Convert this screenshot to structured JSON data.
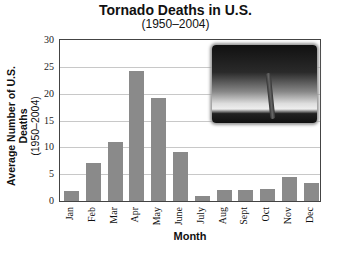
{
  "chart_data": {
    "type": "bar",
    "title": "Tornado Deaths in U.S.",
    "subtitle": "(1950–2004)",
    "xlabel": "Month",
    "ylabel": "Average Number of U.S. Deaths",
    "ylabel_sub": "(1950–2004)",
    "categories": [
      "Jan",
      "Feb",
      "Mar",
      "Apr",
      "May",
      "June",
      "July",
      "Aug",
      "Sept",
      "Oct",
      "Nov",
      "Dec"
    ],
    "values": [
      1.8,
      7.0,
      11.0,
      24.2,
      19.2,
      9.2,
      1.0,
      2.1,
      2.1,
      2.2,
      4.4,
      3.4
    ],
    "yticks": [
      "0",
      "5",
      "10",
      "15",
      "20",
      "25",
      "30"
    ],
    "ylim": [
      0,
      30
    ],
    "grid": true,
    "bar_color": "#8a8a8a",
    "image_inset": "tornado-photo"
  }
}
